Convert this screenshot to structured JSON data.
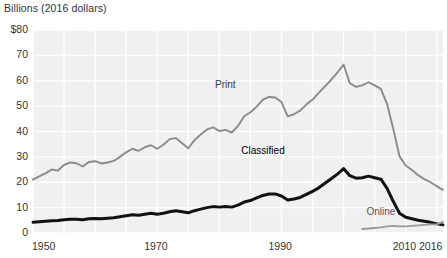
{
  "header": {
    "axis_title": "Billions (2016 dollars)"
  },
  "axes": {
    "y_ticks": [
      "$80",
      "70",
      "60",
      "50",
      "40",
      "30",
      "20",
      "10",
      "0"
    ],
    "y_values": [
      80,
      70,
      60,
      50,
      40,
      30,
      20,
      10,
      0
    ],
    "x_ticks": [
      "1950",
      "1970",
      "1990",
      "2010",
      "2016"
    ],
    "x_values": [
      1950,
      1970,
      1990,
      2010,
      2016
    ]
  },
  "series_labels": {
    "print": "Print",
    "classified": "Classified",
    "online": "Online"
  },
  "colors": {
    "print": "#8a8a8a",
    "classified": "#111111",
    "online": "#9a9a9a",
    "plot_background": "#f0f0f0",
    "gridline": "#ffffff",
    "text": "#333333"
  },
  "chart_data": {
    "type": "line",
    "title": "",
    "subtitle": "",
    "xlabel": "",
    "ylabel": "Billions (2016 dollars)",
    "xlim": [
      1950,
      2016
    ],
    "ylim": [
      0,
      80
    ],
    "grid": true,
    "legend_position": "inline-annotations",
    "annotations": [
      {
        "text": "Print",
        "x": 1981,
        "y": 58
      },
      {
        "text": "Classified",
        "x": 1987,
        "y": 32
      },
      {
        "text": "Online",
        "x": 2006,
        "y": 8
      }
    ],
    "x": [
      1950,
      1951,
      1952,
      1953,
      1954,
      1955,
      1956,
      1957,
      1958,
      1959,
      1960,
      1961,
      1962,
      1963,
      1964,
      1965,
      1966,
      1967,
      1968,
      1969,
      1970,
      1971,
      1972,
      1973,
      1974,
      1975,
      1976,
      1977,
      1978,
      1979,
      1980,
      1981,
      1982,
      1983,
      1984,
      1985,
      1986,
      1987,
      1988,
      1989,
      1990,
      1991,
      1992,
      1993,
      1994,
      1995,
      1996,
      1997,
      1998,
      1999,
      2000,
      2001,
      2002,
      2003,
      2004,
      2005,
      2006,
      2007,
      2008,
      2009,
      2010,
      2011,
      2012,
      2013,
      2014,
      2015,
      2016
    ],
    "series": [
      {
        "name": "Print",
        "color": "#8a8a8a",
        "values": [
          21.0,
          22.3,
          23.5,
          25.0,
          24.6,
          26.8,
          27.8,
          27.5,
          26.2,
          28.0,
          28.3,
          27.4,
          27.8,
          28.4,
          30.0,
          31.8,
          33.2,
          32.4,
          33.8,
          34.6,
          33.2,
          34.8,
          37.0,
          37.4,
          35.4,
          33.4,
          36.6,
          38.8,
          40.8,
          41.6,
          40.2,
          40.6,
          39.6,
          42.2,
          46.0,
          47.6,
          49.8,
          52.6,
          53.6,
          53.4,
          51.6,
          46.0,
          46.8,
          48.2,
          50.6,
          52.6,
          55.2,
          57.8,
          60.4,
          63.2,
          66.4,
          59.0,
          57.6,
          58.2,
          59.4,
          58.2,
          56.8,
          50.8,
          41.0,
          30.2,
          26.6,
          24.8,
          22.8,
          21.2,
          20.0,
          18.4,
          17.0
        ]
      },
      {
        "name": "Classified",
        "color": "#111111",
        "values": [
          4.2,
          4.4,
          4.6,
          4.8,
          4.9,
          5.2,
          5.4,
          5.4,
          5.2,
          5.6,
          5.7,
          5.6,
          5.8,
          6.0,
          6.4,
          6.8,
          7.2,
          7.0,
          7.4,
          7.8,
          7.4,
          7.8,
          8.4,
          8.8,
          8.4,
          8.0,
          8.8,
          9.4,
          10.0,
          10.4,
          10.2,
          10.4,
          10.2,
          11.0,
          12.2,
          12.8,
          13.8,
          14.8,
          15.4,
          15.4,
          14.6,
          13.0,
          13.4,
          14.0,
          15.2,
          16.4,
          17.8,
          19.6,
          21.4,
          23.2,
          25.4,
          22.6,
          21.6,
          21.8,
          22.4,
          21.8,
          21.2,
          17.6,
          12.4,
          7.8,
          6.2,
          5.6,
          5.0,
          4.6,
          4.2,
          3.6,
          3.2
        ]
      },
      {
        "name": "Online",
        "color": "#9a9a9a",
        "values": [
          null,
          null,
          null,
          null,
          null,
          null,
          null,
          null,
          null,
          null,
          null,
          null,
          null,
          null,
          null,
          null,
          null,
          null,
          null,
          null,
          null,
          null,
          null,
          null,
          null,
          null,
          null,
          null,
          null,
          null,
          null,
          null,
          null,
          null,
          null,
          null,
          null,
          null,
          null,
          null,
          null,
          null,
          null,
          null,
          null,
          null,
          null,
          null,
          null,
          null,
          null,
          null,
          null,
          1.6,
          1.8,
          2.0,
          2.2,
          2.6,
          2.8,
          2.6,
          2.6,
          2.8,
          3.0,
          3.2,
          3.4,
          3.4,
          4.4
        ]
      }
    ]
  }
}
